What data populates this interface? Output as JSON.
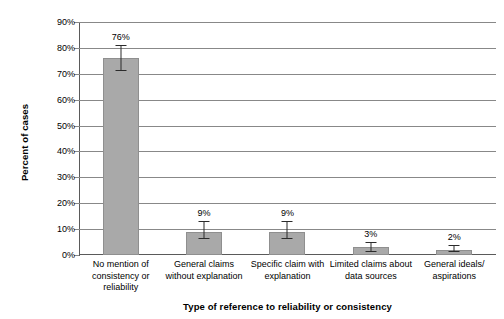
{
  "chart_data": {
    "type": "bar",
    "title": "",
    "xlabel": "Type of reference to reliability or consistency",
    "ylabel": "Percent of cases",
    "categories": [
      "No mention of consistency or reliability",
      "General claims without explanation",
      "Specific claim with explanation",
      "Limited claims about data sources",
      "General ideals/ aspirations"
    ],
    "values": [
      76,
      9,
      9,
      3,
      2
    ],
    "value_labels": [
      "76%",
      "9%",
      "9%",
      "3%",
      "2%"
    ],
    "error_bars": [
      {
        "low": 71,
        "high": 81
      },
      {
        "low": 6,
        "high": 13
      },
      {
        "low": 6,
        "high": 13
      },
      {
        "low": 1,
        "high": 5
      },
      {
        "low": 1,
        "high": 4
      }
    ],
    "ylim": [
      0,
      90
    ],
    "yticks": [
      0,
      10,
      20,
      30,
      40,
      50,
      60,
      70,
      80,
      90
    ],
    "ytick_labels": [
      "0%",
      "10%",
      "20%",
      "30%",
      "40%",
      "50%",
      "60%",
      "70%",
      "80%",
      "90%"
    ],
    "grid": true,
    "legend": "none",
    "bar_color": "#a9a9a9",
    "gridline_color": "#888888",
    "error_bar_color": "#2b2b2b"
  },
  "axis": {
    "y_title": "Percent of cases",
    "x_title": "Type of reference to reliability or consistency"
  },
  "categories_lines": [
    [
      "No mention of",
      "consistency or",
      "reliability"
    ],
    [
      "General claims",
      "without explanation"
    ],
    [
      "Specific claim with",
      "explanation"
    ],
    [
      "Limited claims about",
      "data sources"
    ],
    [
      "General ideals/",
      "aspirations"
    ]
  ]
}
